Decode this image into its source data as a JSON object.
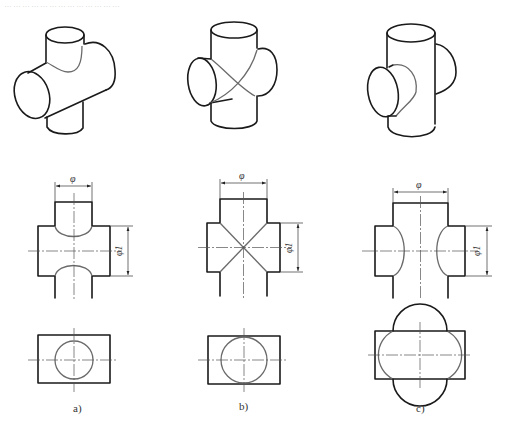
{
  "header": {
    "faded_text": "…………………………………"
  },
  "figures": [
    {
      "id": "a",
      "caption": "a)",
      "description": "Branch diameter smaller than main pipe (φ < φ1) — curved intersection lines",
      "dim_branch": "φ",
      "dim_main": "φ1"
    },
    {
      "id": "b",
      "caption": "b)",
      "description": "Equal diameters (φ = φ1) — intersection lines are straight (X)",
      "dim_branch": "φ",
      "dim_main": "φ1"
    },
    {
      "id": "c",
      "caption": "c)",
      "description": "Branch diameter larger than main pipe (φ > φ1) — curves bow the other way",
      "dim_branch": "φ",
      "dim_main": "φ1"
    }
  ],
  "colors": {
    "outline": "#1a1a1a",
    "intersection": "#6a6a6a",
    "centerline": "#555555",
    "background": "#ffffff"
  }
}
